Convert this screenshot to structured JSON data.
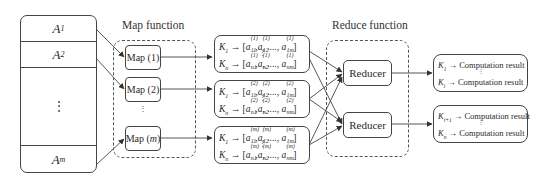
{
  "diagram": {
    "type": "mapreduce-flow",
    "inputs": {
      "rows": [
        {
          "base": "A",
          "sub": "1"
        },
        {
          "base": "A",
          "sub": "2"
        },
        {
          "ellipsis": "⋮"
        },
        {
          "base": "A",
          "sub": "m"
        }
      ]
    },
    "map_stage": {
      "label": "Map function",
      "mappers": [
        {
          "prefix": "Map (",
          "index": "1",
          "suffix": ")"
        },
        {
          "prefix": "Map (",
          "index": "2",
          "suffix": ")"
        },
        {
          "prefix": "Map (",
          "index": "m",
          "suffix": ")"
        }
      ],
      "ellipsis": "⋮"
    },
    "intermediate": [
      {
        "superscript": "(1)",
        "line1": {
          "key": "K",
          "key_sub": "1",
          "arrow": "→",
          "open": "[",
          "terms": [
            {
              "a": "a",
              "sub": "11"
            },
            {
              "a": "a",
              "sub": "12"
            }
          ],
          "dots": ", ...., ",
          "last": {
            "a": "a",
            "sub": "1m"
          },
          "close": "]"
        },
        "line2": {
          "key": "K",
          "key_sub": "n",
          "arrow": "→",
          "open": "[",
          "terms": [
            {
              "a": "a",
              "sub": "n1"
            },
            {
              "a": "a",
              "sub": "n2"
            }
          ],
          "dots": ", ...., ",
          "last": {
            "a": "a",
            "sub": "nm"
          },
          "close": "]"
        }
      },
      {
        "superscript": "(2)",
        "line1": {
          "key": "K",
          "key_sub": "1",
          "arrow": "→",
          "open": "[",
          "terms": [
            {
              "a": "a",
              "sub": "11"
            },
            {
              "a": "a",
              "sub": "12"
            }
          ],
          "dots": ", ...., ",
          "last": {
            "a": "a",
            "sub": "1m"
          },
          "close": "]"
        },
        "line2": {
          "key": "K",
          "key_sub": "n",
          "arrow": "→",
          "open": "[",
          "terms": [
            {
              "a": "a",
              "sub": "n1"
            },
            {
              "a": "a",
              "sub": "n2"
            }
          ],
          "dots": ", ...., ",
          "last": {
            "a": "a",
            "sub": "nm"
          },
          "close": "]"
        }
      },
      {
        "superscript": "(m)",
        "line1": {
          "key": "K",
          "key_sub": "1",
          "arrow": "→",
          "open": "[",
          "terms": [
            {
              "a": "a",
              "sub": "11"
            },
            {
              "a": "a",
              "sub": "12"
            }
          ],
          "dots": ", ...., ",
          "last": {
            "a": "a",
            "sub": "1m"
          },
          "close": "]"
        },
        "line2": {
          "key": "K",
          "key_sub": "n",
          "arrow": "→",
          "open": "[",
          "terms": [
            {
              "a": "a",
              "sub": "n1"
            },
            {
              "a": "a",
              "sub": "n2"
            }
          ],
          "dots": ", ...., ",
          "last": {
            "a": "a",
            "sub": "nm"
          },
          "close": "]"
        }
      }
    ],
    "reduce_stage": {
      "label": "Reduce function",
      "reducers": [
        {
          "label": "Reducer"
        },
        {
          "label": "Reducer"
        }
      ]
    },
    "outputs": [
      {
        "line1": {
          "key": "K",
          "key_sub": "1",
          "arrow": "→",
          "text": "Computation result"
        },
        "line2": {
          "key": "K",
          "key_sub": "i",
          "arrow": "→",
          "text": "Computation result"
        }
      },
      {
        "line1": {
          "key": "K",
          "key_sub": "i+1",
          "arrow": "→",
          "text": "Computation result"
        },
        "line2": {
          "key": "K",
          "key_sub": "n",
          "arrow": "→",
          "text": "Computation result"
        }
      }
    ],
    "colors": {
      "stroke": "#444444",
      "dashed": "#555555",
      "text": "#2a2a2a",
      "background": "#ffffff"
    }
  }
}
